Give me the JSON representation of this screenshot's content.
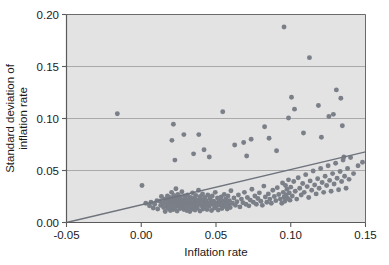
{
  "figure": {
    "background_color": "#ffffff",
    "plot_background_color": "#e3e3e3",
    "gridline_color": "#9a9a9a",
    "frame_color": "#5a5a5a",
    "point_color": "#7a7f88",
    "line_color": "#6e737c"
  },
  "chart_data": {
    "type": "scatter",
    "title": "",
    "subtitle": "",
    "xlabel": "Inflation rate",
    "ylabel": "Standard deviation of inflation rate",
    "ylabel_lines": [
      "Standard deviation of",
      "inflation rate"
    ],
    "xlim": [
      -0.05,
      0.15
    ],
    "ylim": [
      0.0,
      0.2
    ],
    "xticks": [
      -0.05,
      0.0,
      0.05,
      0.1,
      0.15
    ],
    "xtick_labels": [
      "-0.05",
      "0.00",
      "0.05",
      "0.10",
      "0.15"
    ],
    "yticks": [
      0.0,
      0.05,
      0.1,
      0.15,
      0.2
    ],
    "ytick_labels": [
      "0.00",
      "0.05",
      "0.10",
      "0.15",
      "0.20"
    ],
    "grid": "horizontal",
    "legend": null,
    "marker": "circle",
    "marker_size": 3,
    "series": [
      {
        "name": "countries",
        "x": [
          -0.016,
          0.0005,
          0.003,
          0.0055,
          0.0065,
          0.008,
          0.009,
          0.0105,
          0.011,
          0.0125,
          0.013,
          0.0135,
          0.0145,
          0.015,
          0.0155,
          0.016,
          0.0165,
          0.017,
          0.0175,
          0.018,
          0.0182,
          0.0185,
          0.019,
          0.0195,
          0.0198,
          0.02,
          0.0203,
          0.0205,
          0.021,
          0.0213,
          0.0215,
          0.0218,
          0.022,
          0.0222,
          0.0225,
          0.023,
          0.0232,
          0.0235,
          0.0238,
          0.024,
          0.0243,
          0.0245,
          0.025,
          0.0252,
          0.0255,
          0.026,
          0.0262,
          0.0265,
          0.027,
          0.0272,
          0.0275,
          0.028,
          0.0283,
          0.0285,
          0.029,
          0.0293,
          0.0295,
          0.03,
          0.0303,
          0.0305,
          0.031,
          0.0313,
          0.0315,
          0.032,
          0.0323,
          0.0325,
          0.033,
          0.0333,
          0.0335,
          0.034,
          0.0343,
          0.0345,
          0.035,
          0.0353,
          0.0355,
          0.036,
          0.0363,
          0.0365,
          0.037,
          0.0373,
          0.0375,
          0.038,
          0.0383,
          0.0385,
          0.039,
          0.0393,
          0.0395,
          0.04,
          0.0403,
          0.0405,
          0.041,
          0.0413,
          0.0415,
          0.042,
          0.0423,
          0.0425,
          0.043,
          0.0435,
          0.044,
          0.0445,
          0.045,
          0.0455,
          0.046,
          0.0465,
          0.047,
          0.0475,
          0.048,
          0.0485,
          0.049,
          0.0495,
          0.05,
          0.0505,
          0.051,
          0.0515,
          0.052,
          0.0525,
          0.053,
          0.0535,
          0.054,
          0.0545,
          0.055,
          0.0555,
          0.056,
          0.0565,
          0.057,
          0.0575,
          0.058,
          0.0585,
          0.059,
          0.0595,
          0.06,
          0.061,
          0.062,
          0.063,
          0.064,
          0.065,
          0.066,
          0.067,
          0.068,
          0.069,
          0.07,
          0.071,
          0.072,
          0.073,
          0.074,
          0.075,
          0.076,
          0.077,
          0.078,
          0.079,
          0.08,
          0.081,
          0.082,
          0.083,
          0.084,
          0.085,
          0.086,
          0.087,
          0.088,
          0.089,
          0.09,
          0.091,
          0.092,
          0.093,
          0.094,
          0.0945,
          0.095,
          0.0955,
          0.096,
          0.0965,
          0.097,
          0.0975,
          0.098,
          0.0985,
          0.099,
          0.0995,
          0.1,
          0.101,
          0.102,
          0.103,
          0.104,
          0.105,
          0.106,
          0.107,
          0.108,
          0.109,
          0.11,
          0.111,
          0.112,
          0.113,
          0.114,
          0.115,
          0.116,
          0.117,
          0.118,
          0.119,
          0.12,
          0.121,
          0.122,
          0.123,
          0.124,
          0.125,
          0.126,
          0.127,
          0.128,
          0.129,
          0.13,
          0.131,
          0.132,
          0.133,
          0.134,
          0.135,
          0.136,
          0.137,
          0.138,
          0.139,
          0.14,
          0.142,
          0.145,
          0.148,
          0.0205,
          0.0215,
          0.0225,
          0.0285,
          0.035,
          0.0385,
          0.042,
          0.0455,
          0.0545,
          0.0625,
          0.0685,
          0.0705,
          0.0735,
          0.0825,
          0.0855,
          0.0905,
          0.0955,
          0.0985,
          0.1005,
          0.1025,
          0.1085,
          0.1125,
          0.1185,
          0.1205,
          0.1255,
          0.1285,
          0.1305,
          0.1335,
          0.1345,
          0.1355
        ],
        "y": [
          0.1045,
          0.0355,
          0.0185,
          0.016,
          0.0195,
          0.014,
          0.0175,
          0.021,
          0.013,
          0.0205,
          0.0165,
          0.025,
          0.0185,
          0.0145,
          0.0225,
          0.0105,
          0.0195,
          0.016,
          0.0255,
          0.0135,
          0.0215,
          0.018,
          0.024,
          0.0115,
          0.0205,
          0.0165,
          0.029,
          0.015,
          0.023,
          0.019,
          0.0125,
          0.026,
          0.0175,
          0.0215,
          0.0145,
          0.0195,
          0.0325,
          0.0165,
          0.0235,
          0.011,
          0.02,
          0.027,
          0.0155,
          0.022,
          0.0185,
          0.0135,
          0.0245,
          0.0205,
          0.017,
          0.0295,
          0.015,
          0.0215,
          0.019,
          0.0125,
          0.0255,
          0.0175,
          0.023,
          0.016,
          0.02,
          0.0115,
          0.0265,
          0.0185,
          0.0145,
          0.0225,
          0.0195,
          0.0105,
          0.024,
          0.017,
          0.0215,
          0.013,
          0.0285,
          0.0185,
          0.0155,
          0.0205,
          0.0235,
          0.012,
          0.019,
          0.026,
          0.0165,
          0.0215,
          0.014,
          0.0195,
          0.031,
          0.0175,
          0.0225,
          0.011,
          0.025,
          0.0185,
          0.016,
          0.0205,
          0.0275,
          0.013,
          0.022,
          0.019,
          0.015,
          0.024,
          0.017,
          0.021,
          0.0125,
          0.0265,
          0.0185,
          0.0155,
          0.023,
          0.0195,
          0.0115,
          0.0255,
          0.0175,
          0.0205,
          0.014,
          0.029,
          0.0185,
          0.016,
          0.0235,
          0.012,
          0.0215,
          0.0195,
          0.0165,
          0.0245,
          0.0135,
          0.0205,
          0.018,
          0.027,
          0.0155,
          0.0225,
          0.019,
          0.013,
          0.0255,
          0.017,
          0.021,
          0.0145,
          0.0305,
          0.0185,
          0.0235,
          0.0165,
          0.02,
          0.0265,
          0.015,
          0.0225,
          0.019,
          0.029,
          0.0175,
          0.024,
          0.016,
          0.0215,
          0.032,
          0.0195,
          0.0255,
          0.0175,
          0.023,
          0.0285,
          0.0205,
          0.0165,
          0.035,
          0.0245,
          0.0195,
          0.0275,
          0.0225,
          0.0185,
          0.031,
          0.025,
          0.021,
          0.0335,
          0.027,
          0.0225,
          0.0185,
          0.038,
          0.029,
          0.0245,
          0.0205,
          0.0355,
          0.0265,
          0.032,
          0.023,
          0.041,
          0.0285,
          0.0215,
          0.034,
          0.0255,
          0.0395,
          0.03,
          0.0225,
          0.043,
          0.033,
          0.0265,
          0.0375,
          0.029,
          0.046,
          0.0345,
          0.024,
          0.04,
          0.031,
          0.0495,
          0.036,
          0.0275,
          0.042,
          0.033,
          0.052,
          0.0385,
          0.029,
          0.0445,
          0.0355,
          0.0545,
          0.0405,
          0.03,
          0.047,
          0.037,
          0.057,
          0.0425,
          0.0315,
          0.049,
          0.0395,
          0.06,
          0.0445,
          0.033,
          0.052,
          0.0415,
          0.0625,
          0.047,
          0.0545,
          0.058,
          0.079,
          0.0945,
          0.06,
          0.0845,
          0.066,
          0.0845,
          0.07,
          0.063,
          0.1065,
          0.0745,
          0.077,
          0.064,
          0.08,
          0.092,
          0.081,
          0.069,
          0.188,
          0.1005,
          0.1205,
          0.109,
          0.086,
          0.1585,
          0.1125,
          0.082,
          0.102,
          0.104,
          0.1275,
          0.1195,
          0.093,
          0.063
        ]
      }
    ],
    "fit_line": {
      "name": "regression line",
      "x0": -0.05,
      "y0": 0.0,
      "x1": 0.15,
      "y1": 0.068
    }
  }
}
